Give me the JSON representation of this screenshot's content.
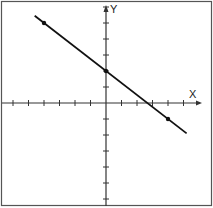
{
  "chart_data": {
    "type": "line",
    "title": "",
    "xlabel": "X",
    "ylabel": "Y",
    "xlim": [
      -6.5,
      5.5
    ],
    "ylim": [
      -6.5,
      6.5
    ],
    "grid": false,
    "axis_ticks": {
      "x": [
        -6,
        -5,
        -4,
        -3,
        -2,
        -1,
        1,
        2,
        3,
        4,
        5
      ],
      "y": [
        -6,
        -5,
        -4,
        -3,
        -2,
        -1,
        1,
        2,
        3,
        4,
        5,
        6
      ]
    },
    "series": [
      {
        "name": "line",
        "equation": "y = -3/4 x + 2",
        "x": [
          -4.6,
          5.2
        ],
        "y": [
          5.45,
          -1.9
        ],
        "marked_points": [
          [
            -4,
            5
          ],
          [
            0,
            2
          ],
          [
            4,
            -1
          ]
        ]
      }
    ]
  },
  "labels": {
    "x_axis": "X",
    "y_axis": "Y"
  },
  "style": {
    "line_color": "#111111",
    "frame_color": "#555555"
  }
}
